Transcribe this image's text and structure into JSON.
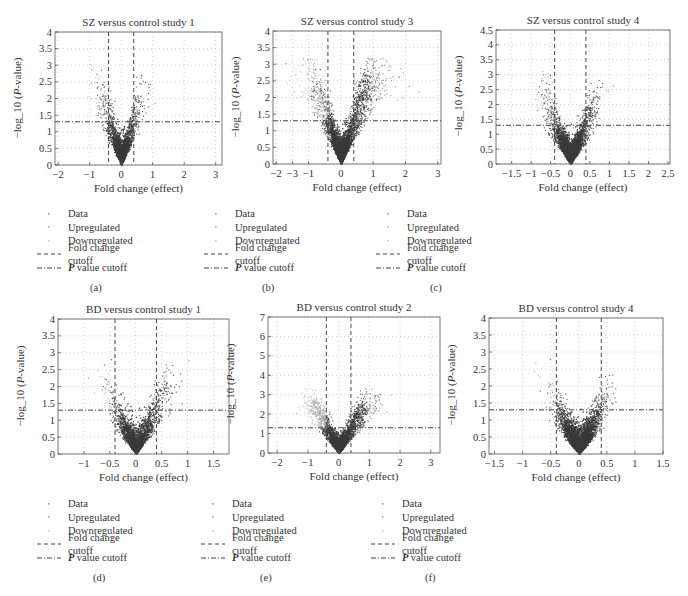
{
  "legend": {
    "items": [
      {
        "label": "Data",
        "type": "dot",
        "color": "#999999"
      },
      {
        "label": "Upregulated",
        "type": "dot",
        "color": "#aaaaaa"
      },
      {
        "label": "Downregulated",
        "type": "dot",
        "color": "#cccccc"
      },
      {
        "label": "Fold change cutoff",
        "type": "dash"
      },
      {
        "label": "value cutoff",
        "prefix": "P",
        "type": "dashdot"
      }
    ]
  },
  "colors": {
    "data_points": "#3a3a3a",
    "downregulated_points": "#a8a8a8",
    "grid": "#b5b5b5",
    "cutoff_lines": "#444444",
    "axis": "#555555"
  },
  "chart_data": [
    {
      "id": "a",
      "type": "scatter",
      "subtype": "volcano",
      "title": "SZ versus control study 1",
      "xlabel": "Fold change (effect)",
      "ylabel": "−log_10 (P-value)",
      "sublabel": "(a)",
      "xlim": [
        -2.1,
        3.2
      ],
      "ylim": [
        0,
        4
      ],
      "xticks": [
        -2,
        -1,
        0,
        1,
        2,
        3
      ],
      "xtick_labels": [
        "−2",
        "−1",
        "0",
        "1",
        "2",
        "3"
      ],
      "yticks": [
        0,
        0.5,
        1,
        1.5,
        2,
        2.5,
        3,
        3.5,
        4
      ],
      "ytick_labels": [
        "0",
        "0.5",
        "1",
        "1.5",
        "2",
        "2.5",
        "3",
        "3.5",
        "4"
      ],
      "fold_change_cutoffs": [
        -0.4,
        0.4
      ],
      "p_value_cutoff": 1.3,
      "grid": true,
      "spread": {
        "left": 1.0,
        "right": 0.9,
        "ymax": 3.1,
        "density": 1.0,
        "down_highlight": 0.15
      },
      "frame": {
        "x": 55,
        "y": 32,
        "w": 167,
        "h": 133
      }
    },
    {
      "id": "b",
      "type": "scatter",
      "subtype": "volcano",
      "title": "SZ versus control study 3",
      "xlabel": "Fold change (effect)",
      "ylabel": "−log_10 (P-value)",
      "sublabel": "(b)",
      "xlim": [
        -2.1,
        3.1
      ],
      "ylim": [
        0,
        4
      ],
      "xticks": [
        -2,
        -1.5,
        -1,
        0,
        1,
        2,
        3
      ],
      "xtick_labels": [
        "−2",
        "−3",
        "−1",
        "0",
        "1",
        "2",
        "3"
      ],
      "yticks": [
        0,
        0.5,
        1,
        1.5,
        2,
        2.5,
        3,
        3.5,
        4
      ],
      "ytick_labels": [
        "0",
        "0.5",
        "1",
        "1.5",
        "2",
        "2.5",
        "3",
        "3.5",
        "4"
      ],
      "fold_change_cutoffs": [
        -0.4,
        0.4
      ],
      "p_value_cutoff": 1.3,
      "grid": true,
      "spread": {
        "left": 1.5,
        "right": 1.8,
        "ymax": 3.2,
        "density": 1.6,
        "down_highlight": 0.35
      },
      "frame": {
        "x": 273,
        "y": 31,
        "w": 168,
        "h": 133
      }
    },
    {
      "id": "c",
      "type": "scatter",
      "subtype": "volcano",
      "title": "SZ versus control study 4",
      "xlabel": "Fold change (effect)",
      "ylabel": "−log_10 (P-value)",
      "sublabel": "(c)",
      "xlim": [
        -1.9,
        2.55
      ],
      "ylim": [
        0,
        4.5
      ],
      "xticks": [
        -1.5,
        -1,
        -0.5,
        0,
        0.5,
        1,
        1.5,
        2,
        2.5
      ],
      "xtick_labels": [
        "−1.5",
        "−1",
        "−0.5",
        "0",
        "0.5",
        "1",
        "1.5",
        "2",
        "2.5"
      ],
      "yticks": [
        0,
        0.5,
        1,
        1.5,
        2,
        2.5,
        3,
        3.5,
        4,
        4.5
      ],
      "ytick_labels": [
        "0",
        "0.5",
        "1",
        "1.5",
        "2",
        "2.5",
        "3",
        "3.5",
        "4",
        "4.5"
      ],
      "fold_change_cutoffs": [
        -0.4,
        0.4
      ],
      "p_value_cutoff": 1.3,
      "grid": true,
      "spread": {
        "left": 1.0,
        "right": 0.9,
        "ymax": 3.6,
        "density": 1.4,
        "down_highlight": 0.1
      },
      "frame": {
        "x": 496,
        "y": 30,
        "w": 174,
        "h": 134
      }
    },
    {
      "id": "d",
      "type": "scatter",
      "subtype": "volcano",
      "title": "BD versus control study 1",
      "xlabel": "Fold change (effect)",
      "ylabel": "−log_10 (P-value)",
      "sublabel": "(d)",
      "xlim": [
        -1.5,
        1.8
      ],
      "ylim": [
        0,
        4
      ],
      "xticks": [
        -1,
        -0.5,
        0,
        0.5,
        1,
        1.5
      ],
      "xtick_labels": [
        "−1",
        "−0.5",
        "0",
        "0.5",
        "1",
        "1.5"
      ],
      "yticks": [
        0,
        0.5,
        1,
        1.5,
        2,
        2.5,
        3,
        3.5,
        4
      ],
      "ytick_labels": [
        "0",
        "0.5",
        "1",
        "1.5",
        "2",
        "2.5",
        "3",
        "3.5",
        "4"
      ],
      "fold_change_cutoffs": [
        -0.4,
        0.4
      ],
      "p_value_cutoff": 1.3,
      "grid": true,
      "spread": {
        "left": 0.75,
        "right": 0.9,
        "ymax": 3.0,
        "density": 1.0,
        "down_highlight": 0.1
      },
      "frame": {
        "x": 58,
        "y": 319,
        "w": 171,
        "h": 135
      }
    },
    {
      "id": "e",
      "type": "scatter",
      "subtype": "volcano",
      "title": "BD versus control study 2",
      "xlabel": "Fold change (effect)",
      "ylabel": "−log_10 (P-value)",
      "sublabel": "(e)",
      "xlim": [
        -2.3,
        3.3
      ],
      "ylim": [
        0,
        7
      ],
      "xticks": [
        -2,
        -1,
        0,
        1,
        2,
        3
      ],
      "xtick_labels": [
        "−2",
        "−1",
        "0",
        "1",
        "2",
        "3"
      ],
      "yticks": [
        0,
        1,
        2,
        3,
        4,
        5,
        6,
        7
      ],
      "ytick_labels": [
        "0",
        "1",
        "2",
        "3",
        "4",
        "5",
        "6",
        "7"
      ],
      "fold_change_cutoffs": [
        -0.4,
        0.4
      ],
      "p_value_cutoff": 1.3,
      "grid": true,
      "spread": {
        "left": 1.4,
        "right": 1.5,
        "ymax": 3.4,
        "density": 1.5,
        "down_highlight": 0.9
      },
      "frame": {
        "x": 268,
        "y": 317,
        "w": 172,
        "h": 136
      }
    },
    {
      "id": "f",
      "type": "scatter",
      "subtype": "volcano",
      "title": "BD versus control study 4",
      "xlabel": "Fold change (effect)",
      "ylabel": "−log_10 (P-value)",
      "sublabel": "(f)",
      "xlim": [
        -1.6,
        1.5
      ],
      "ylim": [
        0,
        4
      ],
      "xticks": [
        -1.5,
        -1,
        -0.5,
        0,
        0.5,
        1,
        1.5
      ],
      "xtick_labels": [
        "−1.5",
        "−1",
        "−0.5",
        "0",
        "0.5",
        "1",
        "1.5"
      ],
      "yticks": [
        0,
        0.5,
        1,
        1.5,
        2,
        2.5,
        3,
        3.5,
        4
      ],
      "ytick_labels": [
        "0",
        "0.5",
        "1",
        "1.5",
        "2",
        "2.5",
        "3",
        "3.5",
        "4"
      ],
      "fold_change_cutoffs": [
        -0.4,
        0.4
      ],
      "p_value_cutoff": 1.3,
      "grid": true,
      "spread": {
        "left": 0.65,
        "right": 0.65,
        "ymax": 3.6,
        "density": 1.5,
        "down_highlight": 0.1
      },
      "frame": {
        "x": 489,
        "y": 318,
        "w": 174,
        "h": 136
      }
    }
  ],
  "layout": {
    "legend_positions": [
      {
        "x": 36,
        "y": 207
      },
      {
        "x": 203,
        "y": 207
      },
      {
        "x": 375,
        "y": 207
      },
      {
        "x": 36,
        "y": 497
      },
      {
        "x": 200,
        "y": 497
      },
      {
        "x": 370,
        "y": 497
      }
    ],
    "sublabel_positions": [
      {
        "x": 90,
        "y": 282
      },
      {
        "x": 262,
        "y": 282
      },
      {
        "x": 430,
        "y": 282
      },
      {
        "x": 93,
        "y": 572
      },
      {
        "x": 260,
        "y": 572
      },
      {
        "x": 425,
        "y": 572
      }
    ]
  }
}
